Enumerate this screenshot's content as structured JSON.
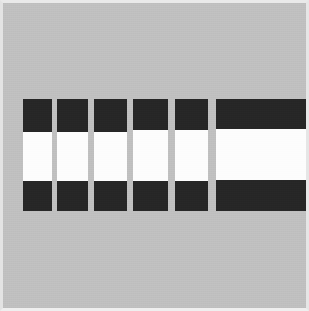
{
  "image": {
    "title": "Six vertical striped bars",
    "description": "Abstract geometric figure: six vertical bars on a flat gray field. Five narrow bars of equal width are evenly spaced at the left; a sixth much wider bar sits at the right and runs off the right edge of the frame. Every bar is divided into three stacked horizontal bands: black on top, white in the middle, black at the bottom.",
    "width_px": 309,
    "height_px": 311
  },
  "palette": {
    "background": "#c0c0c0",
    "band_dark": "#262626",
    "band_light": "#fdfdfd",
    "frame": "#eaeaea"
  },
  "layout": {
    "bar_top_y": 99,
    "bar_bottom_y": 211,
    "bar_total_height": 112
  },
  "bars": [
    {
      "id": "bar-1",
      "label": "Bar 1",
      "x": 23,
      "width": 29,
      "top": 99,
      "height": 112,
      "bands": [
        {
          "name": "top-dark-band",
          "color": "#262626",
          "height": 33
        },
        {
          "name": "middle-light-band",
          "color": "#fdfdfd",
          "height": 49
        },
        {
          "name": "bottom-dark-band",
          "color": "#262626",
          "height": 30
        }
      ]
    },
    {
      "id": "bar-2",
      "label": "Bar 2",
      "x": 57,
      "width": 31,
      "top": 99,
      "height": 112,
      "bands": [
        {
          "name": "top-dark-band",
          "color": "#262626",
          "height": 33
        },
        {
          "name": "middle-light-band",
          "color": "#fdfdfd",
          "height": 49
        },
        {
          "name": "bottom-dark-band",
          "color": "#262626",
          "height": 30
        }
      ]
    },
    {
      "id": "bar-3",
      "label": "Bar 3",
      "x": 94,
      "width": 33,
      "top": 99,
      "height": 112,
      "bands": [
        {
          "name": "top-dark-band",
          "color": "#262626",
          "height": 33
        },
        {
          "name": "middle-light-band",
          "color": "#fdfdfd",
          "height": 49
        },
        {
          "name": "bottom-dark-band",
          "color": "#262626",
          "height": 30
        }
      ]
    },
    {
      "id": "bar-4",
      "label": "Bar 4",
      "x": 133,
      "width": 35,
      "top": 99,
      "height": 112,
      "bands": [
        {
          "name": "top-dark-band",
          "color": "#262626",
          "height": 31
        },
        {
          "name": "middle-light-band",
          "color": "#fdfdfd",
          "height": 51
        },
        {
          "name": "bottom-dark-band",
          "color": "#262626",
          "height": 30
        }
      ]
    },
    {
      "id": "bar-5",
      "label": "Bar 5",
      "x": 175,
      "width": 33,
      "top": 99,
      "height": 112,
      "bands": [
        {
          "name": "top-dark-band",
          "color": "#262626",
          "height": 31
        },
        {
          "name": "middle-light-band",
          "color": "#fdfdfd",
          "height": 51
        },
        {
          "name": "bottom-dark-band",
          "color": "#262626",
          "height": 30
        }
      ]
    },
    {
      "id": "bar-6-wide",
      "label": "Bar 6 (wide)",
      "x": 216,
      "width": 93,
      "top": 99,
      "height": 112,
      "bands": [
        {
          "name": "top-dark-band",
          "color": "#262626",
          "height": 30
        },
        {
          "name": "middle-light-band",
          "color": "#fdfdfd",
          "height": 51
        },
        {
          "name": "bottom-dark-band",
          "color": "#262626",
          "height": 31
        }
      ]
    }
  ]
}
